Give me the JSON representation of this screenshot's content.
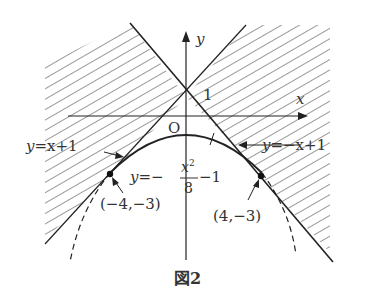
{
  "figure": {
    "caption": "図2",
    "axes": {
      "x_label": "x",
      "y_label": "y",
      "origin_label": "O",
      "y_tick_label": "1"
    },
    "curves": {
      "line1": {
        "label": "y=x+1",
        "eq_left": "y",
        "eq_right": "=x+1"
      },
      "line2": {
        "label": "y=−x+1",
        "eq_left": "y",
        "eq_right": "=−x+1"
      },
      "parabola": {
        "label": "y=−x²/8−1",
        "lhs": "y",
        "eq": "=−",
        "num": "x",
        "sup": "2",
        "den": "8",
        "tail": "−1"
      }
    },
    "points": {
      "left": {
        "label": "(−4,−3)",
        "x": -4,
        "y": -3
      },
      "right": {
        "label": "(4,−3)",
        "x": 4,
        "y": -3
      }
    },
    "shaded_region": "above both lines y=x+1 and y=−x+1 (outside the wedge containing the parabola)"
  },
  "colors": {
    "ink": "#222222",
    "hatch": "#444444",
    "background": "#ffffff"
  }
}
